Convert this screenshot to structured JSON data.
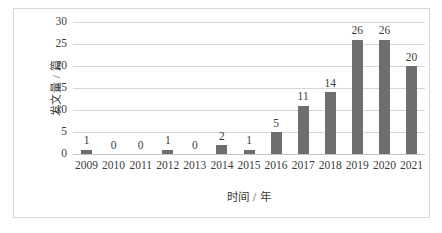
{
  "chart_data": {
    "type": "bar",
    "title": "",
    "subtitle": "",
    "xlabel": "时间 / 年",
    "ylabel": "发文量 / 篇",
    "categories": [
      "2009",
      "2010",
      "2011",
      "2012",
      "2013",
      "2014",
      "2015",
      "2016",
      "2017",
      "2018",
      "2019",
      "2020",
      "2021"
    ],
    "values": [
      1,
      0,
      0,
      1,
      0,
      2,
      1,
      5,
      11,
      14,
      26,
      26,
      20
    ],
    "data_labels": [
      "1",
      "0",
      "0",
      "1",
      "0",
      "2",
      "1",
      "5",
      "11",
      "14",
      "26",
      "26",
      "20"
    ],
    "ylim": [
      0,
      30
    ],
    "ytick_labels": [
      "0",
      "5",
      "10",
      "15",
      "20",
      "25",
      "30"
    ],
    "ytick_values": [
      0,
      5,
      10,
      15,
      20,
      25,
      30
    ],
    "grid": "horizontal",
    "legend": "none",
    "series_name": "",
    "colors": {
      "bar": "#6e6e6e",
      "gridline": "#d6d6d6",
      "text": "#3b3b3b",
      "frame": "#d9d9d9",
      "background": "#ffffff"
    }
  }
}
